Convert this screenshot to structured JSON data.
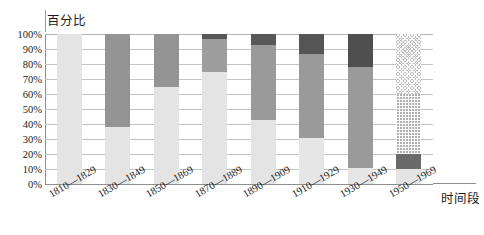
{
  "chart_data": {
    "type": "bar",
    "subtype": "stacked-percentage",
    "title": "百分比",
    "xlabel": "时间段",
    "ylabel": "百分比",
    "ylim": [
      0,
      100
    ],
    "grid": true,
    "legend_position": "none",
    "ytick_labels": [
      "100%",
      "90%",
      "80%",
      "70%",
      "60%",
      "50%",
      "40%",
      "30%",
      "20%",
      "10%",
      "0%"
    ],
    "ytick_values": [
      100,
      90,
      80,
      70,
      60,
      50,
      40,
      30,
      20,
      10,
      0
    ],
    "categories": [
      "1810—1829",
      "1830—1849",
      "1850—1869",
      "1870—1889",
      "1890—1909",
      "1910—1929",
      "1930—1949",
      "1950—1969"
    ],
    "series": [
      {
        "name": "series-1-light",
        "color": "#e4e4e4",
        "pattern": "solid",
        "values": [
          100,
          38,
          65,
          75,
          43,
          31,
          11,
          10
        ]
      },
      {
        "name": "series-2-medium-gray",
        "color": "#9b9b9b",
        "pattern": "solid",
        "values": [
          0,
          62,
          35,
          22,
          50,
          56,
          67,
          10
        ]
      },
      {
        "name": "series-3-dark-gray",
        "color": "#575757",
        "pattern": "solid",
        "values": [
          0,
          0,
          0,
          3,
          7,
          13,
          22,
          40
        ]
      },
      {
        "name": "series-4-hatched",
        "color": "#b8b8b8",
        "pattern": "crosshatch",
        "values": [
          0,
          0,
          0,
          0,
          0,
          0,
          0,
          40
        ]
      }
    ],
    "bars": [
      {
        "category": "1810—1829",
        "segments": [
          {
            "series": "series-1-light",
            "from": 0,
            "to": 100,
            "value": 100,
            "color": "#e4e4e4",
            "pattern": "solid"
          }
        ]
      },
      {
        "category": "1830—1849",
        "segments": [
          {
            "series": "series-1-light",
            "from": 0,
            "to": 38,
            "value": 38,
            "color": "#e4e4e4",
            "pattern": "solid"
          },
          {
            "series": "series-2-medium-gray",
            "from": 38,
            "to": 100,
            "value": 62,
            "color": "#949494",
            "pattern": "solid"
          }
        ]
      },
      {
        "category": "1850—1869",
        "segments": [
          {
            "series": "series-1-light",
            "from": 0,
            "to": 65,
            "value": 65,
            "color": "#e4e4e4",
            "pattern": "solid"
          },
          {
            "series": "series-2-medium-gray",
            "from": 65,
            "to": 100,
            "value": 35,
            "color": "#949494",
            "pattern": "solid"
          }
        ]
      },
      {
        "category": "1870—1889",
        "segments": [
          {
            "series": "series-1-light",
            "from": 0,
            "to": 75,
            "value": 75,
            "color": "#e4e4e4",
            "pattern": "solid"
          },
          {
            "series": "series-2-medium-gray",
            "from": 75,
            "to": 97,
            "value": 22,
            "color": "#9e9e9e",
            "pattern": "solid"
          },
          {
            "series": "series-3-dark-gray",
            "from": 97,
            "to": 100,
            "value": 3,
            "color": "#585858",
            "pattern": "solid"
          }
        ]
      },
      {
        "category": "1890—1909",
        "segments": [
          {
            "series": "series-1-light",
            "from": 0,
            "to": 43,
            "value": 43,
            "color": "#e4e4e4",
            "pattern": "solid"
          },
          {
            "series": "series-2-medium-gray",
            "from": 43,
            "to": 93,
            "value": 50,
            "color": "#9a9a9a",
            "pattern": "solid"
          },
          {
            "series": "series-3-dark-gray",
            "from": 93,
            "to": 100,
            "value": 7,
            "color": "#585858",
            "pattern": "solid"
          }
        ]
      },
      {
        "category": "1910—1929",
        "segments": [
          {
            "series": "series-1-light",
            "from": 0,
            "to": 31,
            "value": 31,
            "color": "#e6e6e6",
            "pattern": "solid"
          },
          {
            "series": "series-2-medium-gray",
            "from": 31,
            "to": 87,
            "value": 56,
            "color": "#9a9a9a",
            "pattern": "solid"
          },
          {
            "series": "series-3-dark-gray",
            "from": 87,
            "to": 100,
            "value": 13,
            "color": "#555555",
            "pattern": "solid"
          }
        ]
      },
      {
        "category": "1930—1949",
        "segments": [
          {
            "series": "series-1-light",
            "from": 0,
            "to": 11,
            "value": 11,
            "color": "#e6e6e6",
            "pattern": "solid"
          },
          {
            "series": "series-2-medium-gray",
            "from": 11,
            "to": 78,
            "value": 67,
            "color": "#9a9a9a",
            "pattern": "solid"
          },
          {
            "series": "series-3-dark-gray",
            "from": 78,
            "to": 100,
            "value": 22,
            "color": "#4f4f4f",
            "pattern": "solid"
          }
        ]
      },
      {
        "category": "1950—1969",
        "segments": [
          {
            "series": "series-1-light",
            "from": 0,
            "to": 10,
            "value": 10,
            "color": "#e4e4e4",
            "pattern": "solid"
          },
          {
            "series": "series-3-dark-gray",
            "from": 10,
            "to": 20,
            "value": 10,
            "color": "#6a6a6a",
            "pattern": "solid"
          },
          {
            "series": "series-4-hatched",
            "from": 20,
            "to": 60,
            "value": 40,
            "color": "#b0b0b0",
            "pattern": "crosshatch"
          },
          {
            "series": "series-4-hatched",
            "from": 60,
            "to": 100,
            "value": 40,
            "color": "#bdbdbd",
            "pattern": "diagonal-dots"
          }
        ]
      }
    ]
  }
}
